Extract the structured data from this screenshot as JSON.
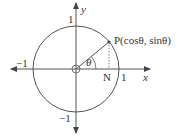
{
  "diagram": {
    "axes": {
      "x_label": "x",
      "y_label": "y"
    },
    "ticks": {
      "x_pos": "1",
      "x_neg": "−1",
      "y_pos": "1",
      "y_neg": "−1"
    },
    "point": {
      "name": "P",
      "label": "P(cosθ, sinθ)"
    },
    "foot": "N",
    "angle": "θ",
    "colors": {
      "stroke": "#555555",
      "text": "#333333"
    }
  }
}
